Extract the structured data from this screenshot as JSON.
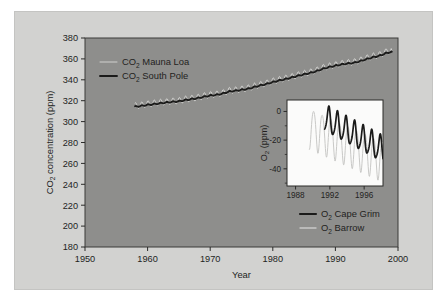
{
  "figure": {
    "background_color": "#d2d2d0",
    "plot_background_color": "#8e8e8c",
    "inset_background_color": "#fbfbfa",
    "text_color": "#231f1e"
  },
  "chart_data": {
    "type": "line",
    "title": "",
    "xlabel": "Year",
    "ylabel": "CO2 concentration (ppm)",
    "ylabel_parts": {
      "main": "CO",
      "sub": "2",
      "tail": " concentration (ppm)"
    },
    "xlim": [
      1950,
      2000
    ],
    "ylim": [
      180,
      380
    ],
    "xticks": [
      1950,
      1960,
      1970,
      1980,
      1990,
      2000
    ],
    "yticks": [
      180,
      200,
      220,
      240,
      260,
      280,
      300,
      320,
      340,
      360,
      380
    ],
    "grid": false,
    "legend_position": "upper-left",
    "series": [
      {
        "name": "CO2 Mauna Loa",
        "label_main": "CO",
        "label_sub": "2",
        "label_tail": " Mauna Loa",
        "color": "#d8d8d6",
        "width": 0.9,
        "description": "Monthly mean CO2 with strong seasonal sawtooth, Northern Hemisphere station",
        "seasonal_amplitude_ppm": 3.0,
        "x": [
          1958,
          1959,
          1960,
          1961,
          1962,
          1963,
          1964,
          1965,
          1966,
          1967,
          1968,
          1969,
          1970,
          1971,
          1972,
          1973,
          1974,
          1975,
          1976,
          1977,
          1978,
          1979,
          1980,
          1981,
          1982,
          1983,
          1984,
          1985,
          1986,
          1987,
          1988,
          1989,
          1990,
          1991,
          1992,
          1993,
          1994,
          1995,
          1996,
          1997,
          1998,
          1999
        ],
        "values": [
          315.0,
          315.8,
          316.9,
          317.6,
          318.4,
          319.0,
          319.6,
          320.0,
          321.4,
          322.2,
          323.1,
          324.6,
          325.7,
          326.3,
          327.5,
          329.7,
          330.2,
          331.1,
          332.0,
          333.8,
          335.4,
          336.8,
          338.7,
          340.1,
          341.4,
          343.0,
          344.6,
          346.0,
          347.4,
          349.2,
          351.6,
          353.1,
          354.4,
          355.6,
          356.4,
          357.1,
          358.8,
          360.8,
          362.6,
          363.8,
          366.6,
          368.3
        ]
      },
      {
        "name": "CO2 South Pole",
        "label_main": "CO",
        "label_sub": "2",
        "label_tail": " South Pole",
        "color": "#1b1b1a",
        "width": 1.9,
        "description": "Smooth CO2 record with very small seasonal cycle, Southern Hemisphere station",
        "seasonal_amplitude_ppm": 0.5,
        "x": [
          1958,
          1959,
          1960,
          1961,
          1962,
          1963,
          1964,
          1965,
          1966,
          1967,
          1968,
          1969,
          1970,
          1971,
          1972,
          1973,
          1974,
          1975,
          1976,
          1977,
          1978,
          1979,
          1980,
          1981,
          1982,
          1983,
          1984,
          1985,
          1986,
          1987,
          1988,
          1989,
          1990,
          1991,
          1992,
          1993,
          1994,
          1995,
          1996,
          1997,
          1998,
          1999
        ],
        "values": [
          314.3,
          315.0,
          316.0,
          316.7,
          317.5,
          318.3,
          318.9,
          319.4,
          320.6,
          321.5,
          322.4,
          323.8,
          324.9,
          325.6,
          326.8,
          328.7,
          329.5,
          330.4,
          331.3,
          333.0,
          334.6,
          336.0,
          337.8,
          339.3,
          340.6,
          342.2,
          343.8,
          345.2,
          346.6,
          348.3,
          350.5,
          352.2,
          353.5,
          354.7,
          355.6,
          356.3,
          357.9,
          359.8,
          361.6,
          362.9,
          365.3,
          366.9
        ]
      }
    ]
  },
  "inset_chart_data": {
    "type": "line",
    "title": "",
    "xlabel": "",
    "ylabel": "O2 (ppm)",
    "ylabel_parts": {
      "main": "O",
      "sub": "2",
      "tail": " (ppm)"
    },
    "xlim": [
      1987,
      1998.2
    ],
    "ylim": [
      -52,
      8
    ],
    "xticks": [
      1988,
      1992,
      1996
    ],
    "yticks": [
      0,
      -20,
      -40
    ],
    "grid": false,
    "legend_position": "below-right",
    "series": [
      {
        "name": "O2 Cape Grim",
        "label_main": "O",
        "label_sub": "2",
        "label_tail": " Cape Grim",
        "color": "#1b1b1a",
        "width": 1.7,
        "start_year": 1991.4,
        "description": "Southern Hemisphere O2 record, declining with seasonal oscillation",
        "seasonal_amplitude_ppm": 9.0,
        "trend_start_ppm": -5.0,
        "trend_end_ppm": -27.0
      },
      {
        "name": "O2 Barrow",
        "label_main": "O",
        "label_sub": "2",
        "label_tail": " Barrow",
        "color": "#c9c9c7",
        "width": 1.0,
        "start_year": 1989.6,
        "description": "Northern Hemisphere O2 record, larger seasonal amplitude, declining",
        "seasonal_amplitude_ppm": 14.0,
        "trend_start_ppm": -11.0,
        "trend_end_ppm": -34.0
      }
    ]
  }
}
